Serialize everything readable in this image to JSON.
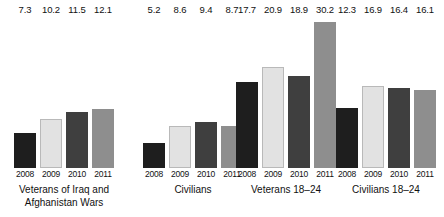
{
  "chart_data": {
    "type": "bar",
    "title": "",
    "subtitle": "",
    "xlabel": "",
    "ylabel": "",
    "ylim": [
      0,
      31
    ],
    "grid": false,
    "legend_position": "none",
    "categories": [
      "2008",
      "2009",
      "2010",
      "2011"
    ],
    "groups": [
      {
        "name": "Veterans of Iraq and Afghanistan Wars",
        "label_lines": [
          "Veterans of Iraq and",
          "Afghanistan Wars"
        ],
        "values": [
          7.3,
          10.2,
          11.5,
          12.1
        ],
        "value_labels": [
          "7.3",
          "10.2",
          "11.5",
          "12.1"
        ],
        "year_labels": [
          "2008",
          "2009",
          "2010",
          "2011"
        ]
      },
      {
        "name": "Civilians",
        "label_lines": [
          "Civilians"
        ],
        "values": [
          5.2,
          8.6,
          9.4,
          8.7
        ],
        "value_labels": [
          "5.2",
          "8.6",
          "9.4",
          "8.7"
        ],
        "year_labels": [
          "2008",
          "2009",
          "2010",
          "2011"
        ]
      },
      {
        "name": "Veterans 18–24",
        "label_lines": [
          "Veterans 18–24"
        ],
        "values": [
          17.7,
          20.9,
          18.9,
          30.2
        ],
        "value_labels": [
          "17.7",
          "20.9",
          "18.9",
          "30.2"
        ],
        "year_labels": [
          "2008",
          "2009",
          "2010",
          "2011"
        ]
      },
      {
        "name": "Civilians 18–24",
        "label_lines": [
          "Civilians 18–24"
        ],
        "values": [
          12.3,
          16.9,
          16.4,
          16.1
        ],
        "value_labels": [
          "12.3",
          "16.9",
          "16.4",
          "16.1"
        ],
        "year_labels": [
          "2008",
          "2009",
          "2010",
          "2011"
        ]
      }
    ],
    "series_colors": {
      "2008": "#1e1e1e",
      "2009": "#e2e2e2",
      "2010": "#3f3f3f",
      "2011": "#8e8e8e"
    },
    "background_color": "#ffffff",
    "text_color": "#111111",
    "px_per_unit": 4.85
  },
  "layout": {
    "group_left_offsets": [
      14,
      143,
      236,
      336
    ],
    "baseline_y": 168
  }
}
